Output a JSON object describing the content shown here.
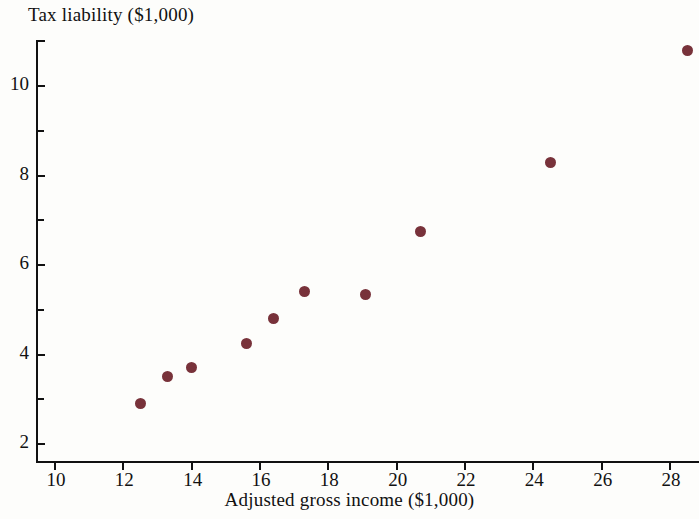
{
  "chart_data": {
    "type": "scatter",
    "title": "",
    "xlabel": "Adjusted gross income ($1,000)",
    "ylabel": "Tax liability ($1,000)",
    "xlim": [
      9.0,
      29.2
    ],
    "ylim": [
      1.6,
      11.4
    ],
    "xticks": [
      10,
      12,
      14,
      16,
      18,
      20,
      22,
      24,
      26,
      28
    ],
    "xticklabels": [
      "10",
      "12",
      "14",
      "16",
      "18",
      "20",
      "22",
      "24",
      "26",
      "28"
    ],
    "yticks": [
      2,
      4,
      6,
      8,
      10
    ],
    "yticklabels": [
      "2",
      "4",
      "6",
      "8",
      "10"
    ],
    "yticks_minor": [
      3,
      5,
      7,
      9
    ],
    "grid": false,
    "legend": false,
    "marker_color": "#78323a",
    "axis_color": "#111111",
    "background_color": "#fdfdfb",
    "points": [
      {
        "x": 12.5,
        "y": 2.9
      },
      {
        "x": 13.3,
        "y": 3.5
      },
      {
        "x": 14.0,
        "y": 3.7
      },
      {
        "x": 15.6,
        "y": 4.25
      },
      {
        "x": 16.4,
        "y": 4.8
      },
      {
        "x": 17.3,
        "y": 5.4
      },
      {
        "x": 19.1,
        "y": 5.35
      },
      {
        "x": 20.7,
        "y": 6.75
      },
      {
        "x": 24.5,
        "y": 8.3
      },
      {
        "x": 28.5,
        "y": 10.8
      }
    ]
  }
}
